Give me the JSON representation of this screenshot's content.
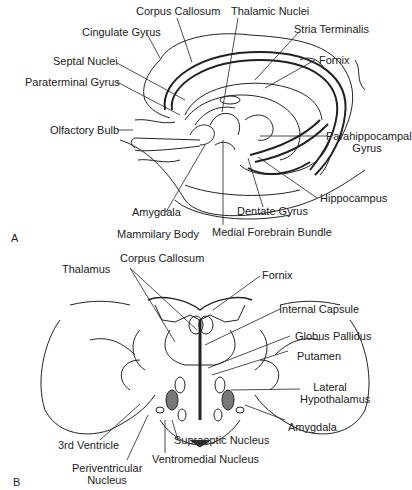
{
  "panel_a": {
    "letter": "A",
    "labels": {
      "corpus_callosum": "Corpus Callosum",
      "thalamic_nuclei": "Thalamic Nuclei",
      "cingulate_gyrus": "Cingulate Gyrus",
      "stria_terminalis": "Stria Terminalis",
      "septal_nuclei": "Septal Nuclei",
      "fornix": "Fornix",
      "paraterminal_gyrus": "Paraterminal Gyrus",
      "olfactory_bulb": "Olfactory Bulb",
      "parahippocampal_1": "Parahippocampal",
      "parahippocampal_2": "Gyrus",
      "hippocampus": "Hippocampus",
      "amygdala": "Amygdala",
      "dentate_gyrus": "Dentate Gyrus",
      "mammilary_body": "Mammilary Body",
      "medial_forebrain_bundle": "Medial Forebrain Bundle"
    }
  },
  "panel_b": {
    "letter": "B",
    "labels": {
      "corpus_callosum": "Corpus Callosum",
      "thalamus": "Thalamus",
      "fornix": "Fornix",
      "internal_capsule": "Internal Capsule",
      "globus_pallidus": "Globus Pallidus",
      "putamen": "Putamen",
      "lateral_hypothalamus_1": "Lateral",
      "lateral_hypothalamus_2": "Hypothalamus",
      "amygdala": "Amygdala",
      "third_ventricle": "3rd Ventricle",
      "supraoptic_nucleus": "Supraoptic Nucleus",
      "ventromedial_nucleus": "Ventromedial Nucleus",
      "periventricular_1": "Periventricular",
      "periventricular_2": "Nucleus"
    }
  }
}
